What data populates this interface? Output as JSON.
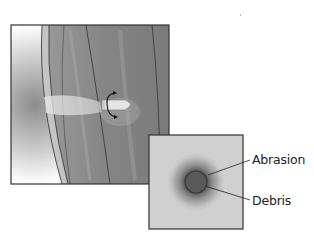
{
  "figure": {
    "main_panel": {
      "description": "Bullet entering skin with rotational spin, showing wound track",
      "elements": [
        "skin-layers",
        "bullet",
        "rotation-arrow",
        "wound-track"
      ]
    },
    "inset_panel": {
      "description": "Close-up of entrance wound",
      "labels": [
        {
          "id": "abrasion",
          "text": "Abrasion"
        },
        {
          "id": "debris",
          "text": "Debris"
        }
      ]
    }
  },
  "colors": {
    "frame": "#333333",
    "skin_tissue": "#8a8a8a",
    "inset_background": "#cfcfcf",
    "wound_center": "#555555"
  }
}
